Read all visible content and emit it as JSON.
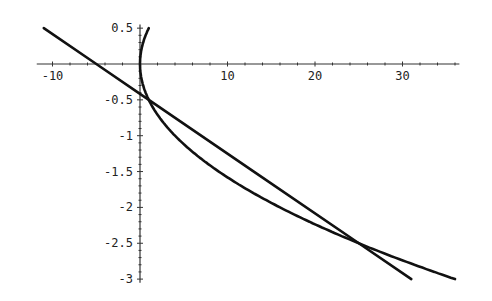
{
  "chart_data": {
    "type": "line",
    "title": "",
    "xlabel": "",
    "ylabel": "",
    "xlim": [
      -11.5,
      36.5
    ],
    "ylim": [
      -3.05,
      0.55
    ],
    "grid": false,
    "legend": null,
    "x_ticks": [
      -10,
      10,
      20,
      30
    ],
    "x_tick_labels": [
      "-10",
      "10",
      "20",
      "30"
    ],
    "y_ticks": [
      0.5,
      -0.5,
      -1,
      -1.5,
      -2,
      -2.5,
      -3
    ],
    "y_tick_labels": [
      "0.5",
      "-0.5",
      "-1",
      "-1.5",
      "-2",
      "-2.5",
      "-3"
    ],
    "series": [
      {
        "name": "line",
        "description": "straight line y = -0.5 - (x - 1)/12",
        "x": [
          -11,
          -5,
          0,
          1,
          13,
          25,
          31
        ],
        "y": [
          0.5,
          0.0,
          -0.4167,
          -0.5,
          -1.5,
          -2.5,
          -3.0
        ]
      },
      {
        "name": "parabola",
        "description": "sideways parabola x = 4y^2",
        "x": [
          1,
          0.25,
          0,
          0.25,
          1,
          4,
          9,
          16,
          25,
          36
        ],
        "y": [
          0.5,
          0.25,
          0,
          -0.25,
          -0.5,
          -1,
          -1.5,
          -2,
          -2.5,
          -3
        ]
      }
    ],
    "annotations": [
      {
        "type": "intersection",
        "x": 1,
        "y": -0.5
      },
      {
        "type": "intersection",
        "x": 25,
        "y": -2.5
      }
    ]
  }
}
